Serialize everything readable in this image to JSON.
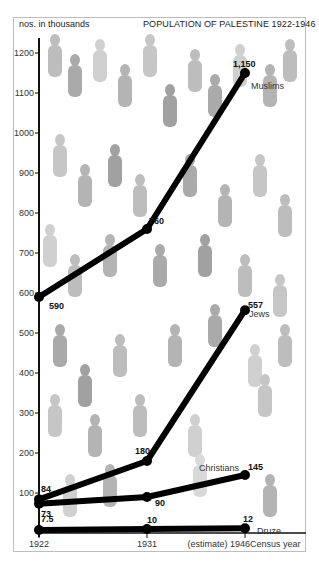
{
  "chart_data": {
    "type": "line",
    "title": "POPULATION OF PALESTINE 1922-1946",
    "ylabel": "nos. in thousands",
    "xlabel": "Census year",
    "x": [
      "1922",
      "1931",
      "1946"
    ],
    "x_tick_labels": [
      "1922",
      "1931",
      "(estimate) 1946"
    ],
    "y_ticks": [
      100,
      200,
      300,
      400,
      500,
      600,
      700,
      800,
      900,
      1000,
      1100,
      1200
    ],
    "ylim": [
      0,
      1250
    ],
    "grid": false,
    "legend": "inline labels at line ends",
    "series": [
      {
        "name": "Muslims",
        "values": [
          590,
          760,
          1150
        ],
        "labels": [
          "590",
          "760",
          "1,150"
        ]
      },
      {
        "name": "Jews",
        "values": [
          84,
          180,
          557
        ],
        "labels": [
          "84",
          "180",
          "557"
        ]
      },
      {
        "name": "Christians",
        "values": [
          73,
          90,
          145
        ],
        "labels": [
          "73",
          "90",
          "145"
        ]
      },
      {
        "name": "Druze",
        "values": [
          7.5,
          10,
          12
        ],
        "labels": [
          "7.5",
          "10",
          "12"
        ]
      }
    ],
    "annotations": [
      "1946 values are estimates"
    ],
    "background": "illustrated crowd of human silhouettes in grey watercolour"
  },
  "text": {
    "title": "POPULATION OF PALESTINE 1922-1946",
    "unit": "nos. in thousands",
    "x_axis_suffix": "Census year",
    "x_estimate_note": "(estimate)"
  }
}
